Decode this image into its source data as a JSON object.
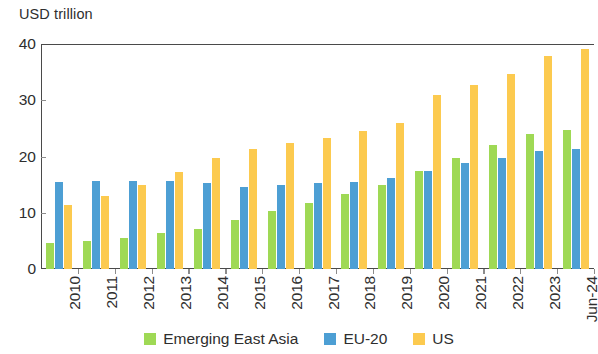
{
  "chart_data": {
    "type": "bar",
    "title": "",
    "subtitle": "",
    "xlabel": "",
    "ylabel": "USD trillion",
    "ylim": [
      0,
      40
    ],
    "yticks": [
      0,
      10,
      20,
      30,
      40
    ],
    "grid": false,
    "legend_position": "bottom",
    "categories": [
      "2010",
      "2011",
      "2012",
      "2013",
      "2014",
      "2015",
      "2016",
      "2017",
      "2018",
      "2019",
      "2020",
      "2021",
      "2022",
      "2023",
      "Jun-24"
    ],
    "series": [
      {
        "name": "Emerging East Asia",
        "color": "#9fd955",
        "values": [
          4.6,
          5.0,
          5.6,
          6.4,
          7.2,
          8.7,
          10.3,
          11.8,
          13.3,
          15.0,
          17.5,
          19.8,
          22.0,
          24.0,
          24.8
        ]
      },
      {
        "name": "EU-20",
        "color": "#4d9fd4",
        "values": [
          15.4,
          15.7,
          15.6,
          15.6,
          15.3,
          14.6,
          15.0,
          15.3,
          15.5,
          16.1,
          17.4,
          18.9,
          19.7,
          20.9,
          21.4
        ]
      },
      {
        "name": "US",
        "color": "#fcca4f",
        "values": [
          11.3,
          12.9,
          15.0,
          17.2,
          19.8,
          21.3,
          22.4,
          23.3,
          24.5,
          26.0,
          31.0,
          32.7,
          34.6,
          37.8,
          39.2
        ]
      }
    ]
  },
  "axis": {
    "y_caption": "USD trillion",
    "y_tick_labels": [
      "0",
      "10",
      "20",
      "30",
      "40"
    ]
  },
  "legend": {
    "items": [
      {
        "label": "Emerging East Asia",
        "color": "#9fd955"
      },
      {
        "label": "EU-20",
        "color": "#4d9fd4"
      },
      {
        "label": "US",
        "color": "#fcca4f"
      }
    ]
  }
}
